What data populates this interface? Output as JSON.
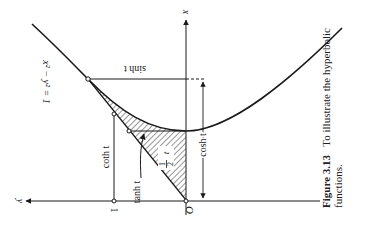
{
  "figure": {
    "caption": {
      "label": "Figure 3.13",
      "text_line1": "To illustrate the hyperbolic",
      "text_line2": "functions."
    },
    "labels": {
      "x_axis": "x",
      "y_axis": "y",
      "origin": "O",
      "unit": "1",
      "hyperbola_eq": "x² − y² = 1",
      "sinh": "sinh t",
      "cosh": "cosh t",
      "tanh": "tanh t",
      "coth": "coth t",
      "area_num": "1",
      "area_den": "2",
      "area_var": "t"
    },
    "orientation": "rotated 90° counter-clockwise (x-axis points up, y-axis points left)",
    "colors": {
      "ink": "#1a1a1a",
      "background": "#ffffff"
    }
  }
}
